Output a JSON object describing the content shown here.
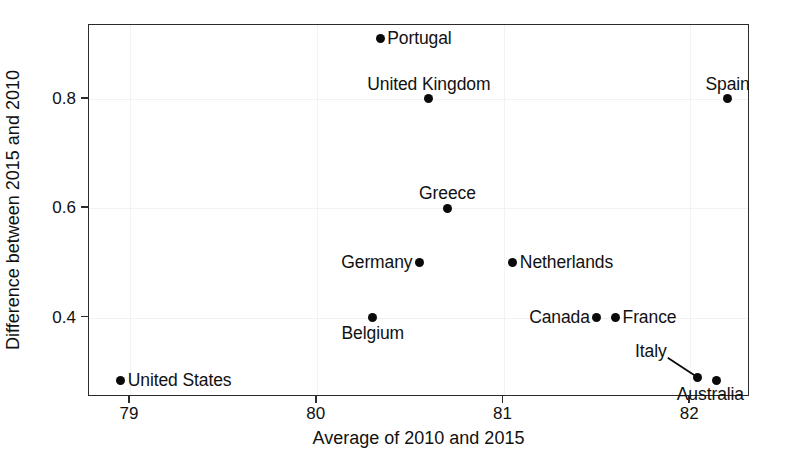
{
  "chart_data": {
    "type": "scatter",
    "title": "",
    "xlabel": "Average of 2010 and 2015",
    "ylabel": "Difference between 2015 and 2010",
    "xlim": [
      78.78,
      82.32
    ],
    "ylim": [
      0.255,
      0.935
    ],
    "xticks": [
      79,
      80,
      81,
      82
    ],
    "xtick_labels": [
      "79",
      "80",
      "81",
      "82"
    ],
    "yticks": [
      0.4,
      0.6,
      0.8
    ],
    "ytick_labels": [
      "0.4",
      "0.6",
      "0.8"
    ],
    "grid": true,
    "legend": "none",
    "marker_color": "#0a0a0a",
    "frame_color": "#2b2b2b",
    "points": [
      {
        "label": "Portugal",
        "x": 80.34,
        "y": 0.91,
        "label_pos": "right"
      },
      {
        "label": "United Kingdom",
        "x": 80.6,
        "y": 0.8,
        "label_pos": "above"
      },
      {
        "label": "Spain",
        "x": 82.2,
        "y": 0.8,
        "label_pos": "above"
      },
      {
        "label": "Greece",
        "x": 80.7,
        "y": 0.6,
        "label_pos": "above"
      },
      {
        "label": "Germany",
        "x": 80.55,
        "y": 0.5,
        "label_pos": "left"
      },
      {
        "label": "Netherlands",
        "x": 81.05,
        "y": 0.5,
        "label_pos": "right"
      },
      {
        "label": "Belgium",
        "x": 80.3,
        "y": 0.4,
        "label_pos": "below"
      },
      {
        "label": "Canada",
        "x": 81.5,
        "y": 0.4,
        "label_pos": "left"
      },
      {
        "label": "France",
        "x": 81.6,
        "y": 0.4,
        "label_pos": "right"
      },
      {
        "label": "Italy",
        "x": 82.04,
        "y": 0.29,
        "label_pos": "leader"
      },
      {
        "label": "Australia",
        "x": 82.14,
        "y": 0.285,
        "label_pos": "below-right"
      },
      {
        "label": "United States",
        "x": 78.95,
        "y": 0.285,
        "label_pos": "right"
      }
    ],
    "annotations": [
      {
        "name": "italy-leader-line",
        "from_label": "Italy",
        "to_point": "Italy"
      }
    ]
  }
}
